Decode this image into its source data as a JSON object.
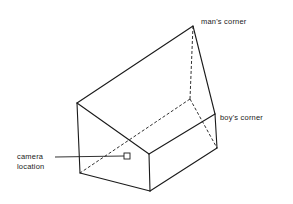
{
  "diagram": {
    "type": "3d-room-wireframe",
    "labels": {
      "man_corner": "man's corner",
      "boy_corner": "boy's corner",
      "camera_line1": "camera",
      "camera_line2": "location"
    },
    "colors": {
      "stroke": "#1a1a1a",
      "background": "#ffffff"
    },
    "vertices": {
      "top_left_front": [
        77,
        103
      ],
      "man_corner": [
        193,
        26
      ],
      "back_bottom_hidden": [
        190,
        99
      ],
      "boy_corner": [
        215,
        114
      ],
      "right_bottom": [
        217,
        148
      ],
      "front_top": [
        149,
        154
      ],
      "front_bottom": [
        150,
        191
      ],
      "left_bottom": [
        80,
        173
      ]
    },
    "camera": {
      "x": 124,
      "y": 153,
      "size": 6
    }
  }
}
